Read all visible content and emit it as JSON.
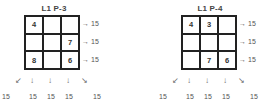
{
  "panels": [
    {
      "title": "L1 P-3",
      "grid": [
        [
          "4",
          "",
          ""
        ],
        [
          "",
          "",
          "7"
        ],
        [
          "8",
          "",
          "6"
        ]
      ],
      "row_sums": [
        "15",
        "15",
        "15"
      ],
      "arrows": {
        "diag_left": "↙",
        "down": "↓",
        "diag_right": "↘",
        "right": "→"
      },
      "bottom_sums": {
        "diag_left": "15",
        "col1": "15",
        "col2": "15",
        "col3": "15",
        "diag_right": "15"
      }
    },
    {
      "title": "L1 P-4",
      "grid": [
        [
          "4",
          "3",
          ""
        ],
        [
          "",
          "",
          ""
        ],
        [
          "",
          "7",
          "6"
        ]
      ],
      "row_sums": [
        "15",
        "15",
        "15"
      ],
      "arrows": {
        "diag_left": "↙",
        "down": "↓",
        "diag_right": "↘",
        "right": "→"
      },
      "bottom_sums": {
        "diag_left": "15",
        "col1": "15",
        "col2": "15",
        "col3": "15",
        "diag_right": "15"
      }
    }
  ]
}
